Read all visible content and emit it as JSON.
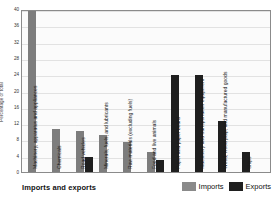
{
  "footer": {
    "title": "Imports and exports"
  },
  "legend": {
    "position": "bottom-right",
    "items": [
      {
        "label": "Imports",
        "color": "#8a8a8a",
        "key": "imports"
      },
      {
        "label": "Exports",
        "color": "#1f1f1f",
        "key": "exports"
      }
    ]
  },
  "chart_data": {
    "type": "bar",
    "title": "Imports and exports",
    "xlabel": "",
    "ylabel": "Percentage of total",
    "ylim": [
      0,
      40
    ],
    "ytick_step": 4,
    "yticks": [
      40,
      36,
      32,
      28,
      24,
      20,
      16,
      12,
      8,
      4,
      0
    ],
    "grid": true,
    "categories": [
      "Machinery, apparatus and appliances",
      "Chemicals",
      "Road vehicles",
      "Minerals, fuels, and lubricants",
      "Raw materials (excluding fuels)",
      "Food and live animals",
      "Paper and paper board",
      "Machinery and transportation equipment",
      "Wood, wood pulp, and manufactured goods",
      "Ships"
    ],
    "series": [
      {
        "name": "Imports",
        "color": "#7d7d7d",
        "values": [
          39.5,
          10.5,
          10,
          9,
          7.3,
          5,
          0,
          0,
          0,
          0
        ]
      },
      {
        "name": "Exports",
        "color": "#1f1f1f",
        "values": [
          0,
          0,
          3.7,
          0,
          0,
          3,
          23.8,
          23.8,
          12.5,
          5
        ]
      }
    ]
  }
}
